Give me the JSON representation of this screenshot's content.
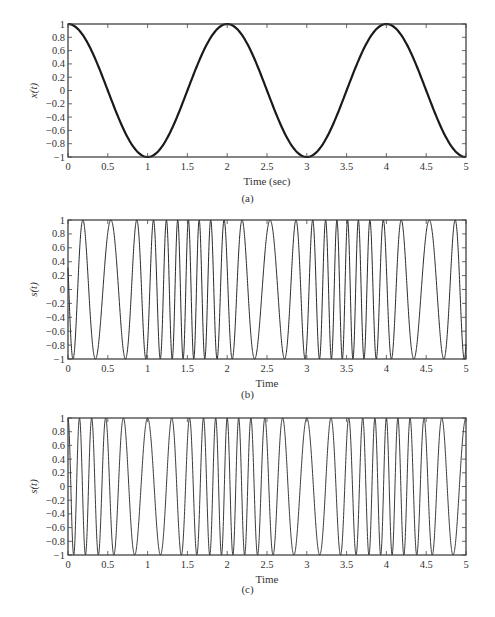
{
  "chart_data": [
    {
      "id": "a",
      "type": "line",
      "title": "",
      "caption": "(a)",
      "xlabel": "Time (sec)",
      "ylabel": "x(t)",
      "xlim": [
        0,
        5
      ],
      "ylim": [
        -1,
        1
      ],
      "xticks": [
        "0",
        "0.5",
        "1",
        "1.5",
        "2",
        "2.5",
        "3",
        "3.5",
        "4",
        "4.5",
        "5"
      ],
      "yticks": [
        "1",
        "0.8",
        "0.6",
        "0.4",
        "0.2",
        "0",
        "-0.2",
        "-0.4",
        "-0.6",
        "-0.8",
        "-1"
      ],
      "grid": false,
      "series": [
        {
          "name": "x(t)",
          "formula": "cos(pi*t)",
          "line_width": 2.2,
          "color": "#1a1a1a",
          "x": [
            0,
            0.5,
            1,
            1.5,
            2,
            2.5,
            3,
            3.5,
            4,
            4.5,
            5
          ],
          "values": [
            1,
            0,
            -1,
            0,
            1,
            0,
            -1,
            0,
            1,
            0,
            -1
          ]
        }
      ]
    },
    {
      "id": "b",
      "type": "line",
      "title": "",
      "caption": "(b)",
      "xlabel": "Time",
      "ylabel": "s(t)",
      "xlim": [
        0,
        5
      ],
      "ylim": [
        -1,
        1
      ],
      "xticks": [
        "0",
        "0.5",
        "1",
        "1.5",
        "2",
        "2.5",
        "3",
        "3.5",
        "4",
        "4.5",
        "5"
      ],
      "yticks": [
        "1",
        "0.8",
        "0.6",
        "0.4",
        "0.2",
        "0",
        "-0.2",
        "-0.4",
        "-0.6",
        "-0.8",
        "-1"
      ],
      "grid": false,
      "series": [
        {
          "name": "s(t) phase-modulated",
          "formula": "cos(2*pi*5*t + 5*cos(pi*t) + phi0)",
          "carrier_hz": 5,
          "deviation": 5,
          "phi0": -3.75,
          "line_width": 1,
          "color": "#2a2a2a",
          "peak_times_approx": [
            0.05,
            0.34,
            0.72,
            1.0,
            1.18,
            1.32,
            1.46,
            1.61,
            1.76,
            1.89,
            2.09,
            2.36,
            2.7,
            2.93,
            3.12,
            3.28,
            3.42,
            3.55,
            3.69,
            3.84,
            4.0,
            4.3,
            4.7,
            5.0
          ]
        }
      ]
    },
    {
      "id": "c",
      "type": "line",
      "title": "",
      "caption": "(c)",
      "xlabel": "Time",
      "ylabel": "s(t)",
      "xlim": [
        0,
        5
      ],
      "ylim": [
        -1,
        1
      ],
      "xticks": [
        "0",
        "0.5",
        "1",
        "1.5",
        "2",
        "2.5",
        "3",
        "3.5",
        "4",
        "4.5",
        "5"
      ],
      "yticks": [
        "1",
        "0.8",
        "0.6",
        "0.4",
        "0.2",
        "0",
        "-0.2",
        "-0.4",
        "-0.6",
        "-0.8",
        "-1"
      ],
      "grid": false,
      "series": [
        {
          "name": "s(t) frequency-modulated",
          "formula": "cos(2*pi*5*t + 4*sin(pi*t))",
          "carrier_hz": 5,
          "deviation": 4,
          "phi0": 0,
          "line_width": 1,
          "color": "#3a3a3a",
          "peak_times_approx": [
            0,
            0.14,
            0.29,
            0.45,
            0.68,
            1.02,
            1.37,
            1.57,
            1.73,
            1.88,
            2.02,
            2.14,
            2.28,
            2.42,
            2.62,
            2.98,
            3.33,
            3.55,
            3.71,
            3.86,
            4.0,
            4.13,
            4.27,
            4.4,
            4.62,
            4.98
          ]
        }
      ]
    }
  ],
  "figures": [
    {
      "top": 12,
      "height": 195,
      "frame": {
        "x": 68,
        "y": 12,
        "w": 398,
        "h": 133
      }
    },
    {
      "top": 208,
      "height": 196,
      "frame": {
        "x": 68,
        "y": 12,
        "w": 398,
        "h": 139
      }
    },
    {
      "top": 405,
      "height": 200,
      "frame": {
        "x": 68,
        "y": 13,
        "w": 398,
        "h": 137
      }
    }
  ]
}
